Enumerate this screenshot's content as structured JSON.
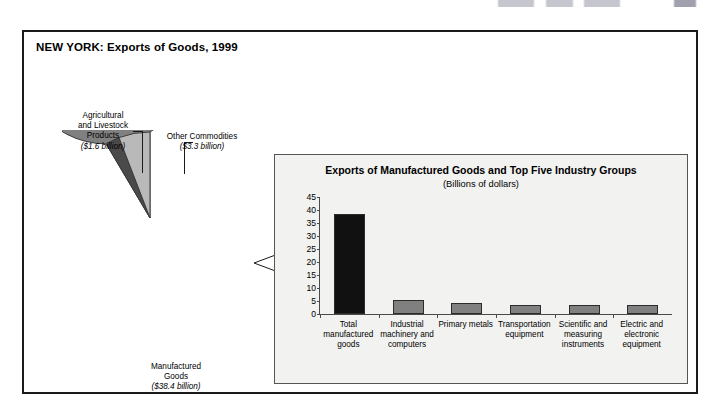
{
  "figure": {
    "title": "NEW YORK: Exports of Goods, 1999"
  },
  "pie": {
    "slices": [
      {
        "name": "manufactured-goods",
        "label_line1": "Manufactured",
        "label_line2": "Goods",
        "amount": "($38.4 billion)",
        "value": 38.4,
        "color": "#808080"
      },
      {
        "name": "other-commodities",
        "label_line1": "Other Commodities",
        "label_line2": "",
        "amount": "($3.3 billion)",
        "value": 3.3,
        "color": "#b9b9b9"
      },
      {
        "name": "agricultural-and-livestock-products",
        "label_line1": "Agricultural",
        "label_line2": "and Livestock",
        "label_line3": "Products",
        "amount": "($1.6 billion)",
        "value": 1.6,
        "color": "#4a4a4a"
      }
    ]
  },
  "chart_data": {
    "type": "bar",
    "title": "Exports of Manufactured Goods and Top Five Industry Groups",
    "subtitle": "(Billions of dollars)",
    "xlabel": "",
    "ylabel": "",
    "ylim": [
      0,
      45
    ],
    "yticks": [
      45,
      40,
      35,
      30,
      25,
      20,
      15,
      10,
      5,
      0
    ],
    "grid": false,
    "legend": "none",
    "categories": [
      "Total manufactured goods",
      "Industrial machinery and computers",
      "Primary metals",
      "Transportation equipment",
      "Scientific and measuring instruments",
      "Electric and electronic equipment"
    ],
    "values": [
      38.4,
      5.2,
      4.2,
      3.4,
      3.3,
      3.3
    ],
    "bar_colors": [
      "#111111",
      "#808080",
      "#808080",
      "#808080",
      "#808080",
      "#808080"
    ]
  },
  "colors": {
    "frame": "#1a1a1a",
    "panel_background": "#f2f2f0",
    "panel_border": "#555555",
    "axis": "#4a4a4a",
    "bar_highlight": "#111111",
    "bar_default": "#808080"
  }
}
